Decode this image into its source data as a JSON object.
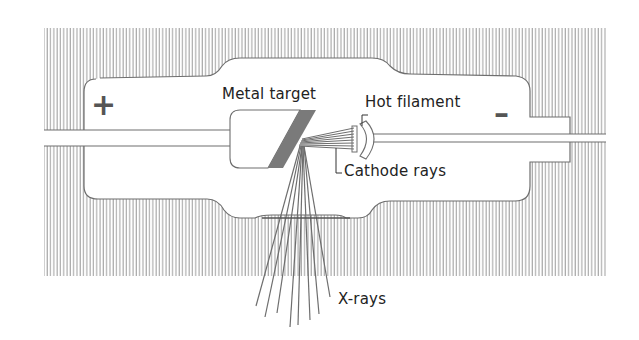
{
  "diagram": {
    "labels": {
      "metal_target": "Metal target",
      "hot_filament": "Hot filament",
      "cathode_rays": "Cathode rays",
      "x_rays": "X-rays"
    },
    "polarity": {
      "anode": "+",
      "cathode": "–"
    },
    "colors": {
      "line": "#6e6e6e",
      "hatch": "#8a8a8a",
      "target": "#7a7a7a",
      "background": "#ffffff",
      "text": "#222222"
    }
  }
}
